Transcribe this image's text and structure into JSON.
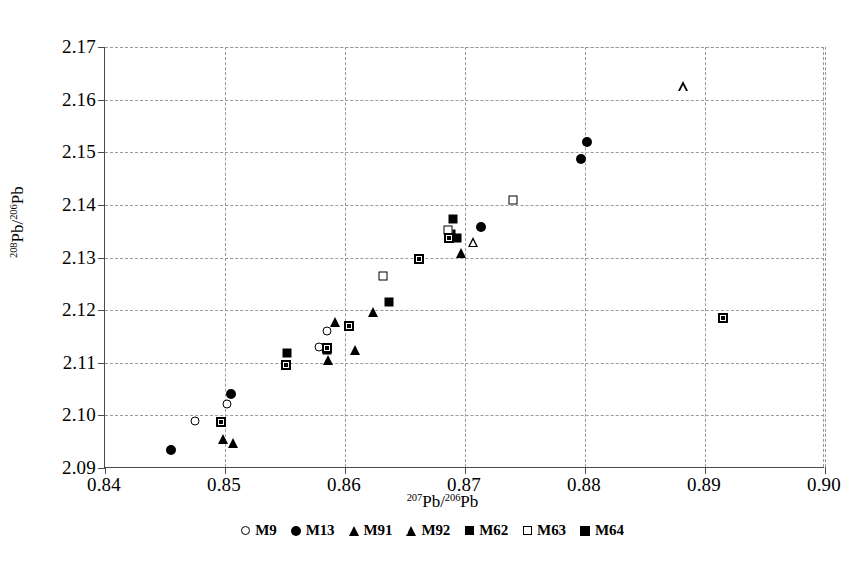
{
  "chart_data": {
    "type": "scatter",
    "title": "",
    "xlabel": "207Pb/206Pb",
    "ylabel": "208Pb/206Pb",
    "xlabel_parts": {
      "sup": "207",
      "base": "Pb/",
      "sup2": "206",
      "base2": "Pb"
    },
    "ylabel_parts": {
      "sup": "208",
      "base": "Pb/",
      "sup2": "206",
      "base2": "Pb"
    },
    "xlim": [
      0.84,
      0.9
    ],
    "ylim": [
      2.09,
      2.17
    ],
    "xticks": [
      "0.84",
      "0.85",
      "0.86",
      "0.87",
      "0.88",
      "0.89",
      "0.90"
    ],
    "xtick_values": [
      0.84,
      0.85,
      0.86,
      0.87,
      0.88,
      0.89,
      0.9
    ],
    "yticks": [
      "2.09",
      "2.10",
      "2.11",
      "2.12",
      "2.13",
      "2.14",
      "2.15",
      "2.16",
      "2.17"
    ],
    "ytick_values": [
      2.09,
      2.1,
      2.11,
      2.12,
      2.13,
      2.14,
      2.15,
      2.16,
      2.17
    ],
    "grid": true,
    "legend_position": "bottom",
    "series": [
      {
        "name": "M9",
        "marker": "circle-open",
        "points": [
          [
            0.8475,
            2.099
          ],
          [
            0.8502,
            2.1022
          ],
          [
            0.8578,
            2.113
          ],
          [
            0.8585,
            2.116
          ]
        ]
      },
      {
        "name": "M13",
        "marker": "circle-fill",
        "points": [
          [
            0.8455,
            2.0935
          ],
          [
            0.8505,
            2.104
          ],
          [
            0.8713,
            2.1358
          ],
          [
            0.8797,
            2.1487
          ],
          [
            0.8802,
            2.152
          ]
        ]
      },
      {
        "name": "M91",
        "marker": "triangle-fill",
        "points": [
          [
            0.8498,
            2.0955
          ],
          [
            0.8507,
            2.0948
          ],
          [
            0.8586,
            2.1105
          ],
          [
            0.8592,
            2.1178
          ],
          [
            0.8608,
            2.1125
          ],
          [
            0.8623,
            2.1197
          ],
          [
            0.8697,
            2.1308
          ]
        ]
      },
      {
        "name": "M92",
        "marker": "triangle-open",
        "points": [
          [
            0.8707,
            2.133
          ],
          [
            0.8882,
            2.1625
          ]
        ]
      },
      {
        "name": "M62",
        "marker": "square-fill",
        "points": [
          [
            0.8552,
            2.1118
          ],
          [
            0.8585,
            2.1125
          ],
          [
            0.8637,
            2.1215
          ],
          [
            0.8688,
            2.1345
          ],
          [
            0.869,
            2.1373
          ],
          [
            0.8693,
            2.1338
          ]
        ]
      },
      {
        "name": "M63",
        "marker": "square-open",
        "points": [
          [
            0.8632,
            2.1265
          ],
          [
            0.8686,
            2.1352
          ],
          [
            0.874,
            2.141
          ]
        ]
      },
      {
        "name": "M64",
        "marker": "square-half",
        "points": [
          [
            0.8497,
            2.0988
          ],
          [
            0.8551,
            2.1095
          ],
          [
            0.8585,
            2.1128
          ],
          [
            0.8603,
            2.117
          ],
          [
            0.8662,
            2.1297
          ],
          [
            0.8687,
            2.1338
          ],
          [
            0.8915,
            2.1185
          ]
        ]
      }
    ]
  }
}
